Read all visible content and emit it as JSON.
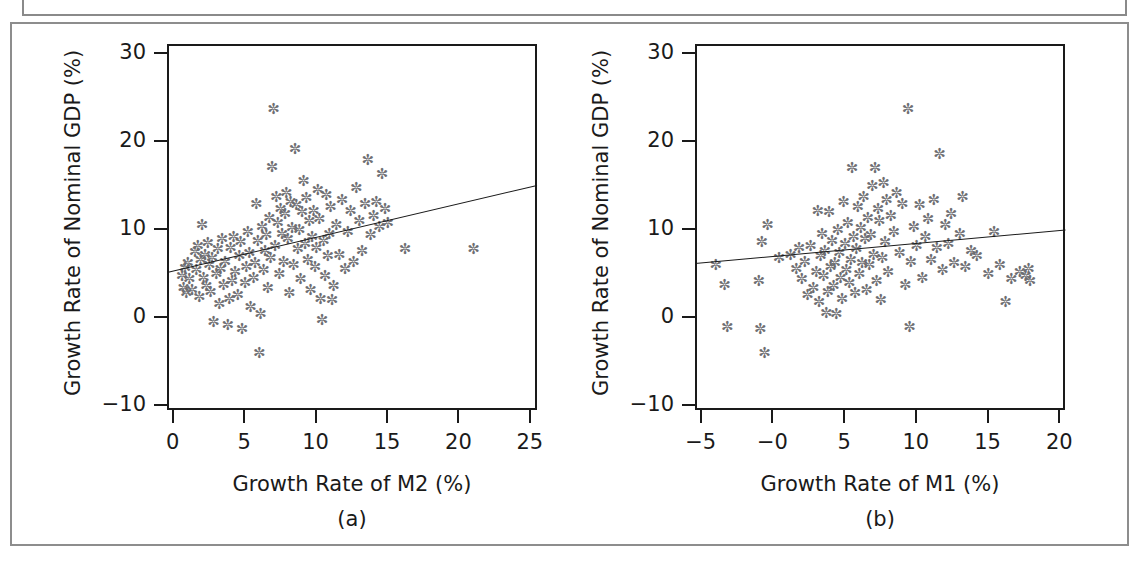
{
  "figure": {
    "background_color": "#ffffff",
    "frame_color": "#8d8d8d",
    "axis_color": "#1a1a1a",
    "marker_color": "#6e6e72",
    "marker_glyph": "✼",
    "line_color": "#1a1a1a"
  },
  "chart_data": [
    {
      "type": "scatter",
      "panel": "a",
      "caption": "(a)",
      "title": "",
      "xlabel": "Growth Rate of M2 (%)",
      "ylabel": "Growth Rate of Nominal GDP (%)",
      "xlim": [
        -0.4,
        25.5
      ],
      "ylim": [
        -10.6,
        31.0
      ],
      "xticks": [
        0,
        5,
        10,
        15,
        20,
        25
      ],
      "xticklabels": [
        "0",
        "5",
        "10",
        "15",
        "20",
        "25"
      ],
      "yticks": [
        -10,
        0,
        10,
        20,
        30
      ],
      "yticklabels": [
        "-10",
        "0",
        "10",
        "20",
        "30"
      ],
      "grid": false,
      "legend": "none",
      "trendline": {
        "x": [
          -0.4,
          25.5
        ],
        "y": [
          5.1,
          15.0
        ]
      },
      "points": [
        [
          0.6,
          4.6
        ],
        [
          0.7,
          3.2
        ],
        [
          0.8,
          5.5
        ],
        [
          0.9,
          2.6
        ],
        [
          1.0,
          6.0
        ],
        [
          1.1,
          4.2
        ],
        [
          1.3,
          3.0
        ],
        [
          1.5,
          7.3
        ],
        [
          1.6,
          5.2
        ],
        [
          1.7,
          8.0
        ],
        [
          1.8,
          2.2
        ],
        [
          1.9,
          6.4
        ],
        [
          2.0,
          10.4
        ],
        [
          2.1,
          4.4
        ],
        [
          2.2,
          7.0
        ],
        [
          2.3,
          3.4
        ],
        [
          2.4,
          8.3
        ],
        [
          2.5,
          5.8
        ],
        [
          2.6,
          2.8
        ],
        [
          2.7,
          6.6
        ],
        [
          2.8,
          -0.6
        ],
        [
          3.0,
          4.8
        ],
        [
          3.1,
          7.6
        ],
        [
          3.2,
          1.4
        ],
        [
          3.3,
          5.4
        ],
        [
          3.4,
          8.8
        ],
        [
          3.5,
          3.6
        ],
        [
          3.6,
          6.2
        ],
        [
          3.8,
          -1.0
        ],
        [
          3.9,
          2.0
        ],
        [
          4.0,
          7.8
        ],
        [
          4.1,
          4.0
        ],
        [
          4.2,
          9.0
        ],
        [
          4.3,
          5.0
        ],
        [
          4.5,
          2.4
        ],
        [
          4.6,
          6.8
        ],
        [
          4.7,
          8.4
        ],
        [
          4.8,
          -1.4
        ],
        [
          5.0,
          3.8
        ],
        [
          5.1,
          5.6
        ],
        [
          5.2,
          9.6
        ],
        [
          5.3,
          7.2
        ],
        [
          5.4,
          1.0
        ],
        [
          5.6,
          4.4
        ],
        [
          5.7,
          6.0
        ],
        [
          5.8,
          12.8
        ],
        [
          5.9,
          8.6
        ],
        [
          6.0,
          -4.2
        ],
        [
          6.1,
          0.2
        ],
        [
          6.2,
          10.2
        ],
        [
          6.3,
          5.2
        ],
        [
          6.4,
          7.4
        ],
        [
          6.5,
          9.2
        ],
        [
          6.6,
          3.2
        ],
        [
          6.7,
          11.2
        ],
        [
          6.8,
          6.6
        ],
        [
          6.9,
          17.0
        ],
        [
          7.0,
          23.6
        ],
        [
          7.1,
          8.0
        ],
        [
          7.2,
          13.6
        ],
        [
          7.3,
          10.6
        ],
        [
          7.4,
          4.8
        ],
        [
          7.5,
          12.2
        ],
        [
          7.6,
          9.4
        ],
        [
          7.7,
          6.2
        ],
        [
          7.8,
          11.6
        ],
        [
          7.9,
          14.0
        ],
        [
          8.0,
          8.8
        ],
        [
          8.1,
          2.6
        ],
        [
          8.2,
          13.0
        ],
        [
          8.3,
          10.0
        ],
        [
          8.4,
          5.8
        ],
        [
          8.5,
          19.0
        ],
        [
          8.6,
          12.6
        ],
        [
          8.7,
          7.6
        ],
        [
          8.8,
          9.8
        ],
        [
          8.9,
          4.2
        ],
        [
          9.0,
          11.8
        ],
        [
          9.1,
          15.4
        ],
        [
          9.2,
          8.2
        ],
        [
          9.3,
          13.4
        ],
        [
          9.4,
          6.4
        ],
        [
          9.5,
          10.8
        ],
        [
          9.6,
          3.0
        ],
        [
          9.7,
          9.0
        ],
        [
          9.8,
          12.0
        ],
        [
          9.9,
          5.6
        ],
        [
          10.0,
          7.8
        ],
        [
          10.1,
          14.4
        ],
        [
          10.2,
          11.0
        ],
        [
          10.3,
          2.0
        ],
        [
          10.4,
          -0.4
        ],
        [
          10.5,
          8.6
        ],
        [
          10.6,
          4.6
        ],
        [
          10.7,
          13.8
        ],
        [
          10.8,
          6.8
        ],
        [
          10.9,
          9.4
        ],
        [
          11.0,
          12.4
        ],
        [
          11.1,
          1.8
        ],
        [
          11.2,
          3.4
        ],
        [
          11.4,
          10.4
        ],
        [
          11.6,
          7.0
        ],
        [
          11.8,
          13.2
        ],
        [
          12.0,
          5.4
        ],
        [
          12.2,
          9.6
        ],
        [
          12.4,
          12.0
        ],
        [
          12.6,
          6.2
        ],
        [
          12.8,
          14.6
        ],
        [
          13.0,
          10.8
        ],
        [
          13.2,
          7.4
        ],
        [
          13.4,
          12.8
        ],
        [
          13.6,
          17.8
        ],
        [
          13.8,
          9.2
        ],
        [
          14.0,
          11.4
        ],
        [
          14.2,
          13.0
        ],
        [
          14.4,
          10.2
        ],
        [
          14.6,
          16.2
        ],
        [
          14.8,
          12.2
        ],
        [
          15.0,
          10.6
        ],
        [
          16.2,
          7.6
        ],
        [
          21.0,
          7.6
        ]
      ]
    },
    {
      "type": "scatter",
      "panel": "b",
      "caption": "(b)",
      "title": "",
      "xlabel": "Growth Rate of M1 (%)",
      "ylabel": "Growth Rate of Nominal GDP (%)",
      "xlim": [
        -5.4,
        20.4
      ],
      "ylim": [
        -10.6,
        31.0
      ],
      "xticks": [
        -5,
        0,
        5,
        10,
        15,
        20
      ],
      "xticklabels": [
        "-5",
        "-0",
        "5",
        "10",
        "15",
        "20"
      ],
      "yticks": [
        -10,
        0,
        10,
        20,
        30
      ],
      "yticklabels": [
        "-10",
        "0",
        "10",
        "20",
        "30"
      ],
      "grid": false,
      "legend": "none",
      "trendline": {
        "x": [
          -5.4,
          20.4
        ],
        "y": [
          6.1,
          9.9
        ]
      },
      "points": [
        [
          -4.0,
          5.8
        ],
        [
          -3.4,
          3.6
        ],
        [
          -3.2,
          -1.2
        ],
        [
          -1.0,
          4.0
        ],
        [
          -0.9,
          -1.4
        ],
        [
          -0.8,
          8.4
        ],
        [
          -0.6,
          -4.2
        ],
        [
          -0.4,
          10.4
        ],
        [
          0.4,
          6.6
        ],
        [
          1.2,
          7.0
        ],
        [
          1.6,
          5.4
        ],
        [
          1.8,
          7.8
        ],
        [
          2.0,
          4.2
        ],
        [
          2.2,
          6.2
        ],
        [
          2.4,
          2.4
        ],
        [
          2.6,
          8.0
        ],
        [
          2.8,
          3.2
        ],
        [
          3.0,
          5.0
        ],
        [
          3.1,
          12.0
        ],
        [
          3.2,
          1.6
        ],
        [
          3.3,
          6.8
        ],
        [
          3.4,
          9.4
        ],
        [
          3.5,
          4.6
        ],
        [
          3.6,
          7.4
        ],
        [
          3.7,
          0.4
        ],
        [
          3.8,
          2.8
        ],
        [
          3.9,
          11.8
        ],
        [
          4.0,
          5.6
        ],
        [
          4.1,
          8.6
        ],
        [
          4.2,
          3.4
        ],
        [
          4.3,
          6.0
        ],
        [
          4.4,
          0.2
        ],
        [
          4.5,
          9.8
        ],
        [
          4.6,
          7.2
        ],
        [
          4.7,
          4.4
        ],
        [
          4.8,
          2.0
        ],
        [
          4.9,
          13.0
        ],
        [
          5.0,
          8.2
        ],
        [
          5.1,
          5.2
        ],
        [
          5.2,
          10.6
        ],
        [
          5.3,
          3.8
        ],
        [
          5.4,
          6.4
        ],
        [
          5.5,
          16.8
        ],
        [
          5.6,
          9.0
        ],
        [
          5.7,
          2.6
        ],
        [
          5.8,
          7.6
        ],
        [
          5.9,
          12.4
        ],
        [
          6.0,
          4.8
        ],
        [
          6.1,
          10.0
        ],
        [
          6.2,
          6.0
        ],
        [
          6.3,
          13.6
        ],
        [
          6.4,
          8.8
        ],
        [
          6.5,
          3.0
        ],
        [
          6.6,
          11.2
        ],
        [
          6.7,
          5.8
        ],
        [
          6.8,
          9.2
        ],
        [
          6.9,
          14.8
        ],
        [
          7.0,
          7.0
        ],
        [
          7.1,
          16.8
        ],
        [
          7.2,
          4.0
        ],
        [
          7.3,
          12.2
        ],
        [
          7.4,
          10.8
        ],
        [
          7.5,
          1.8
        ],
        [
          7.6,
          6.6
        ],
        [
          7.7,
          15.2
        ],
        [
          7.8,
          8.4
        ],
        [
          7.9,
          13.2
        ],
        [
          8.0,
          5.0
        ],
        [
          8.2,
          11.4
        ],
        [
          8.4,
          9.6
        ],
        [
          8.6,
          14.0
        ],
        [
          8.8,
          7.2
        ],
        [
          9.0,
          12.8
        ],
        [
          9.2,
          3.6
        ],
        [
          9.4,
          23.6
        ],
        [
          9.5,
          -1.2
        ],
        [
          9.6,
          6.2
        ],
        [
          9.8,
          10.2
        ],
        [
          10.0,
          8.0
        ],
        [
          10.2,
          12.6
        ],
        [
          10.4,
          4.4
        ],
        [
          10.6,
          9.0
        ],
        [
          10.8,
          11.0
        ],
        [
          11.0,
          6.4
        ],
        [
          11.2,
          13.2
        ],
        [
          11.4,
          7.8
        ],
        [
          11.6,
          18.4
        ],
        [
          11.8,
          5.2
        ],
        [
          12.0,
          10.4
        ],
        [
          12.2,
          8.2
        ],
        [
          12.4,
          11.6
        ],
        [
          12.6,
          6.0
        ],
        [
          13.0,
          9.4
        ],
        [
          13.2,
          13.6
        ],
        [
          13.4,
          5.6
        ],
        [
          13.8,
          7.4
        ],
        [
          14.2,
          6.8
        ],
        [
          15.0,
          4.8
        ],
        [
          15.4,
          9.6
        ],
        [
          15.8,
          5.8
        ],
        [
          16.2,
          1.6
        ],
        [
          16.6,
          4.2
        ],
        [
          17.2,
          5.0
        ],
        [
          17.6,
          4.6
        ],
        [
          17.8,
          5.4
        ],
        [
          17.9,
          4.0
        ]
      ]
    }
  ]
}
